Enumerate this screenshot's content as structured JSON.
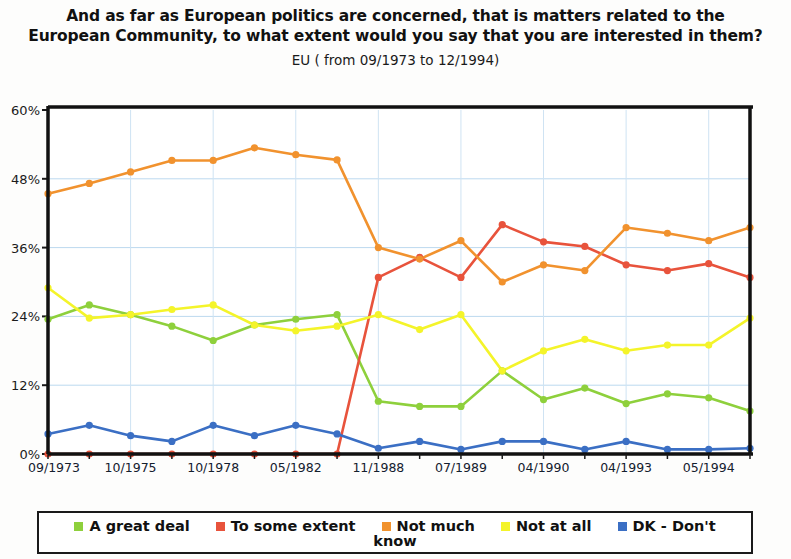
{
  "header": {
    "title": "And as far as European politics are concerned, that is matters related to the European Community, to what extent would you say that you are interested in them?",
    "subtitle": "EU ( from 09/1973 to 12/1994)"
  },
  "legend": {
    "items": [
      {
        "label": "A great deal",
        "color": "#8ed03c"
      },
      {
        "label": "To some extent",
        "color": "#e8533c"
      },
      {
        "label": "Not much",
        "color": "#f1922e"
      },
      {
        "label": "Not at all",
        "color": "#f4f42a"
      },
      {
        "label": "DK - Don't",
        "color": "#3b6fc4"
      }
    ],
    "wrapped_word": "know"
  },
  "axis": {
    "y_ticks": [
      "0%",
      "12%",
      "24%",
      "36%",
      "48%",
      "60%"
    ],
    "x_ticks_top": [
      "09/1973",
      "10/1975",
      "10/1978",
      "05/1982",
      "11/1988",
      "07/1989",
      "04/1990",
      "04/1993",
      "05/1994"
    ],
    "x_ticks_bottom": [
      "05/1975",
      "11/1976",
      "04/1980",
      "11/1986",
      "03/1989",
      "11/1989",
      "11/1990",
      "11/1993",
      "12/1994"
    ]
  },
  "chart_data": {
    "type": "line",
    "title": "And as far as European politics are concerned, that is matters related to the European Community, to what extent would you say that you are interested in them?",
    "subtitle": "EU ( from 09/1973 to 12/1994)",
    "xlabel": "",
    "ylabel": "",
    "ylim": [
      0,
      60
    ],
    "yticks": [
      0,
      12,
      24,
      36,
      48,
      60
    ],
    "grid": true,
    "legend_position": "bottom",
    "categories": [
      "09/1973",
      "05/1975",
      "10/1975",
      "11/1976",
      "10/1978",
      "04/1980",
      "05/1982",
      "11/1986",
      "11/1988",
      "03/1989",
      "07/1989",
      "11/1989",
      "04/1990",
      "11/1990",
      "04/1993",
      "11/1993",
      "05/1994",
      "12/1994"
    ],
    "series": [
      {
        "name": "A great deal",
        "color": "#8ed03c",
        "values": [
          23.5,
          26.0,
          24.3,
          22.3,
          19.8,
          22.5,
          23.5,
          24.3,
          9.2,
          8.3,
          8.3,
          14.5,
          9.5,
          11.5,
          8.8,
          10.5,
          9.8,
          7.5
        ]
      },
      {
        "name": "To some extent",
        "color": "#e8533c",
        "values": [
          0,
          0,
          0,
          0,
          0,
          0,
          0,
          0,
          30.8,
          34.3,
          30.8,
          40.0,
          37.0,
          36.2,
          33.0,
          32.0,
          33.2,
          30.8
        ]
      },
      {
        "name": "Not much",
        "color": "#f1922e",
        "values": [
          45.4,
          47.2,
          49.2,
          51.2,
          51.2,
          53.4,
          52.2,
          51.3,
          36.0,
          34.0,
          37.2,
          30.0,
          33.0,
          32.0,
          39.5,
          38.5,
          37.2,
          39.5
        ]
      },
      {
        "name": "Not at all",
        "color": "#f4f42a",
        "values": [
          29.0,
          23.7,
          24.3,
          25.2,
          26.0,
          22.5,
          21.5,
          22.3,
          24.3,
          21.7,
          24.3,
          14.5,
          18.0,
          20.0,
          18.0,
          19.0,
          19.0,
          23.7
        ]
      },
      {
        "name": "DK - Don't know",
        "color": "#3b6fc4",
        "values": [
          3.5,
          5.0,
          3.2,
          2.2,
          5.0,
          3.2,
          5.0,
          3.5,
          1.0,
          2.2,
          0.8,
          2.2,
          2.2,
          0.8,
          2.2,
          0.8,
          0.8,
          1.0
        ]
      }
    ]
  }
}
